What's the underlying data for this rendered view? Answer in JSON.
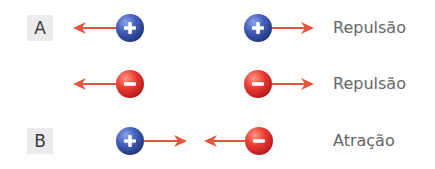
{
  "colors": {
    "arrow": "#e4553f",
    "positive_charge": "#3d57b0",
    "negative_charge": "#e63a34",
    "text": "#666666",
    "label_bg": "#ececee"
  },
  "sections": [
    {
      "label": "A",
      "rows": [
        {
          "left": {
            "charge": "positive",
            "symbol": "+",
            "force_direction": "left"
          },
          "right": {
            "charge": "positive",
            "symbol": "+",
            "force_direction": "right"
          },
          "interaction": "Repulsão"
        },
        {
          "left": {
            "charge": "negative",
            "symbol": "−",
            "force_direction": "left"
          },
          "right": {
            "charge": "negative",
            "symbol": "−",
            "force_direction": "right"
          },
          "interaction": "Repulsão"
        }
      ]
    },
    {
      "label": "B",
      "rows": [
        {
          "left": {
            "charge": "positive",
            "symbol": "+",
            "force_direction": "right"
          },
          "right": {
            "charge": "negative",
            "symbol": "−",
            "force_direction": "left"
          },
          "interaction": "Atração"
        }
      ]
    }
  ]
}
